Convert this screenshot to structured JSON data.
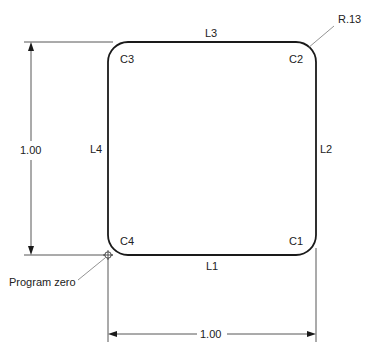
{
  "diagram": {
    "title": "",
    "part": {
      "shape": "rounded-square",
      "corner_radius_label": "R.13",
      "lines": [
        "L1",
        "L2",
        "L3",
        "L4"
      ],
      "corners": [
        "C1",
        "C2",
        "C3",
        "C4"
      ]
    },
    "dimensions": {
      "height_label": "1.00",
      "width_label": "1.00"
    },
    "origin": {
      "label": "Program zero",
      "icon": "program-zero-icon"
    },
    "labels": {
      "L1": "L1",
      "L2": "L2",
      "L3": "L3",
      "L4": "L4",
      "C1": "C1",
      "C2": "C2",
      "C3": "C3",
      "C4": "C4",
      "radius": "R.13",
      "height": "1.00",
      "width": "1.00",
      "program_zero": "Program zero"
    }
  }
}
